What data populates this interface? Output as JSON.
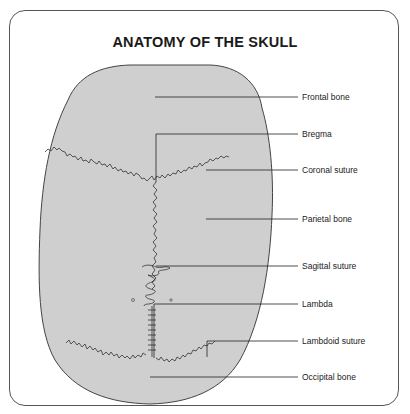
{
  "title": "ANATOMY OF THE SKULL",
  "colors": {
    "skull_fill": "#cfcfcf",
    "outline": "#444444",
    "frame": "#555555",
    "text": "#222222"
  },
  "labels": [
    {
      "id": "frontal-bone",
      "text": "Frontal bone"
    },
    {
      "id": "bregma",
      "text": "Bregma"
    },
    {
      "id": "coronal-suture",
      "text": "Coronal suture"
    },
    {
      "id": "parietal-bone",
      "text": "Parietal bone"
    },
    {
      "id": "sagittal-suture",
      "text": "Sagittal suture"
    },
    {
      "id": "lambda",
      "text": "Lambda"
    },
    {
      "id": "lambdoid-suture",
      "text": "Lambdoid suture"
    },
    {
      "id": "occipital-bone",
      "text": "Occipital bone"
    }
  ]
}
